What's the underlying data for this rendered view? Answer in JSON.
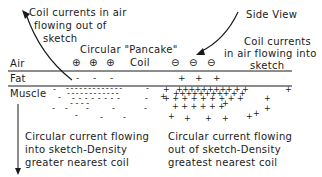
{
  "labels": {
    "top_left": [
      "Coil currents in air",
      "flowing out of",
      "sketch"
    ],
    "side_view": "Side View",
    "top_right": [
      "Coil currents",
      "in air flowing into",
      "sketch"
    ],
    "pancake": "Circular \"Pancake\"",
    "coil": "Coil",
    "air": "Air",
    "fat": "Fat",
    "muscle": "Muscle",
    "bottom_left": [
      "Circular current flowing",
      "into sketch-Density",
      "greater nearest coil"
    ],
    "bottom_right": [
      "Circular current flowing",
      "out of sketch-Density",
      "greatest nearest coil"
    ]
  },
  "symbols": {
    "out_of_sketch": "⊕",
    "into_sketch": "⊖",
    "negative_charge": "-",
    "positive_charge": "+"
  },
  "colors": {
    "ink": "#1a1a1a",
    "background": "#ffffff"
  }
}
